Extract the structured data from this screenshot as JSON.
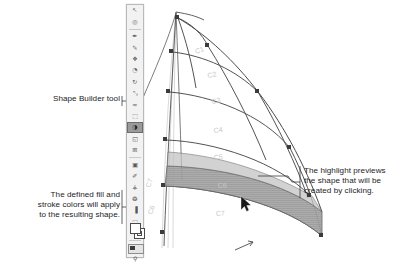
{
  "page": {
    "background_color": "#ffffff",
    "width": 410,
    "height": 258
  },
  "annotations": {
    "shape_builder": {
      "text": "Shape Builder tool",
      "position": "left"
    },
    "fill_stroke": {
      "text": "The defined fill and\nstroke colors will apply\nto the resulting shape.",
      "position": "left-bottom"
    },
    "highlight": {
      "text": "The highlight previews\nthe shape that will be\ncreated by clicking.",
      "position": "right"
    }
  },
  "toolbar": {
    "name": "Illustrator Tools panel",
    "selected_tool": "shape-builder-tool",
    "items": [
      {
        "name": "selection-tool",
        "glyph": "↖"
      },
      {
        "name": "magic-wand-tool",
        "glyph": "◎"
      },
      {
        "name": "pen-tool",
        "glyph": "✒"
      },
      {
        "name": "pencil-tool",
        "glyph": "✎"
      },
      {
        "name": "blob-brush-tool",
        "glyph": "❖"
      },
      {
        "name": "eraser-tool",
        "glyph": "◔"
      },
      {
        "name": "rotate-tool",
        "glyph": "↻"
      },
      {
        "name": "scale-tool",
        "glyph": "⤡"
      },
      {
        "name": "warp-tool",
        "glyph": "≈"
      },
      {
        "name": "free-transform-tool",
        "glyph": "⬚"
      },
      {
        "name": "shape-builder-tool",
        "glyph": "◑",
        "selected": true
      },
      {
        "name": "perspective-grid-tool",
        "glyph": "◱"
      },
      {
        "name": "mesh-tool",
        "glyph": "⊞"
      },
      {
        "name": "gradient-tool",
        "glyph": "▣"
      },
      {
        "name": "eyedropper-tool",
        "glyph": "✐"
      },
      {
        "name": "blend-tool",
        "glyph": "⚶"
      },
      {
        "name": "symbol-sprayer-tool",
        "glyph": "❂"
      },
      {
        "name": "column-graph-tool",
        "glyph": "▐"
      },
      {
        "name": "artboard-tool",
        "glyph": "⬚"
      },
      {
        "name": "slice-tool",
        "glyph": "✂"
      },
      {
        "name": "hand-tool",
        "glyph": "☚"
      },
      {
        "name": "zoom-tool",
        "glyph": "⚲"
      }
    ],
    "swatches": {
      "fill_label": "fill-swatch",
      "fill_color": "#ffffff",
      "stroke_label": "stroke-swatch",
      "stroke_color": "#ffffff",
      "default_color": "#3a3a3a"
    }
  },
  "artwork": {
    "name": "sail-diagram",
    "highlight_color": "#9d9d9d",
    "stroke_color": "#4a4a4a",
    "anchor_color": "#3b3b3b",
    "guide_color": "#c4c4c4",
    "curve_labels": [
      "C1",
      "C2",
      "C3",
      "C4",
      "C5",
      "C6",
      "C7"
    ],
    "cursor": "shape-builder-cursor"
  }
}
